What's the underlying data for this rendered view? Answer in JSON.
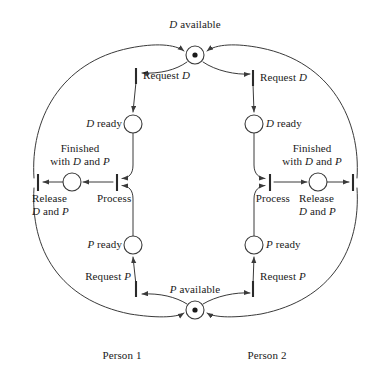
{
  "diagram": {
    "type": "petri-net",
    "background_color": "#ffffff",
    "line_color": "#3a3a3a",
    "text_color": "#1a1a1a",
    "width": 381,
    "height": 371
  },
  "labels": {
    "d_available": "D available",
    "p_available": "P available",
    "request_d_left": "Request D",
    "request_d_right": "Request D",
    "d_ready_left": "D ready",
    "d_ready_right": "D ready",
    "finished_left_line1": "Finished",
    "finished_left_line2": "with D and P",
    "finished_right_line1": "Finished",
    "finished_right_line2": "with D and P",
    "release_left_line1": "Release",
    "release_left_line2": "D and P",
    "release_right_line1": "Release",
    "release_right_line2": "D and P",
    "process_left": "Process",
    "process_right": "Process",
    "p_ready_left": "P ready",
    "p_ready_right": "P ready",
    "request_p_left": "Request P",
    "request_p_right": "Request P",
    "person_1": "Person 1",
    "person_2": "Person 2"
  },
  "places": [
    {
      "name": "d-available",
      "label": "D available",
      "x": 195,
      "y": 55,
      "r": 9,
      "tokens": 1
    },
    {
      "name": "d-ready-left",
      "label": "D ready",
      "x": 133,
      "y": 124,
      "r": 9,
      "tokens": 0
    },
    {
      "name": "d-ready-right",
      "label": "D ready",
      "x": 254,
      "y": 124,
      "r": 9,
      "tokens": 0
    },
    {
      "name": "finished-left",
      "label": "Finished with D and P",
      "x": 72,
      "y": 182,
      "r": 9,
      "tokens": 0
    },
    {
      "name": "finished-right",
      "label": "Finished with D and P",
      "x": 318,
      "y": 182,
      "r": 9,
      "tokens": 0
    },
    {
      "name": "p-ready-left",
      "label": "P ready",
      "x": 133,
      "y": 245,
      "r": 9,
      "tokens": 0
    },
    {
      "name": "p-ready-right",
      "label": "P ready",
      "x": 254,
      "y": 245,
      "r": 9,
      "tokens": 0
    },
    {
      "name": "p-available",
      "label": "P available",
      "x": 195,
      "y": 310,
      "r": 9,
      "tokens": 1
    }
  ],
  "transitions": [
    {
      "name": "request-d-left",
      "label": "Request D",
      "x": 136,
      "y": 76,
      "orientation": "vertical"
    },
    {
      "name": "request-d-right",
      "label": "Request D",
      "x": 253,
      "y": 78,
      "orientation": "vertical"
    },
    {
      "name": "process-left",
      "label": "Process",
      "x": 117,
      "y": 182,
      "orientation": "vertical"
    },
    {
      "name": "process-right",
      "label": "Process",
      "x": 270,
      "y": 182,
      "orientation": "vertical"
    },
    {
      "name": "release-left",
      "label": "Release D and P",
      "x": 38,
      "y": 182,
      "orientation": "vertical"
    },
    {
      "name": "release-right",
      "label": "Release D and P",
      "x": 353,
      "y": 182,
      "orientation": "vertical"
    },
    {
      "name": "request-p-left",
      "label": "Request P",
      "x": 136,
      "y": 289,
      "orientation": "vertical"
    },
    {
      "name": "request-p-right",
      "label": "Request P",
      "x": 253,
      "y": 289,
      "orientation": "vertical"
    }
  ]
}
